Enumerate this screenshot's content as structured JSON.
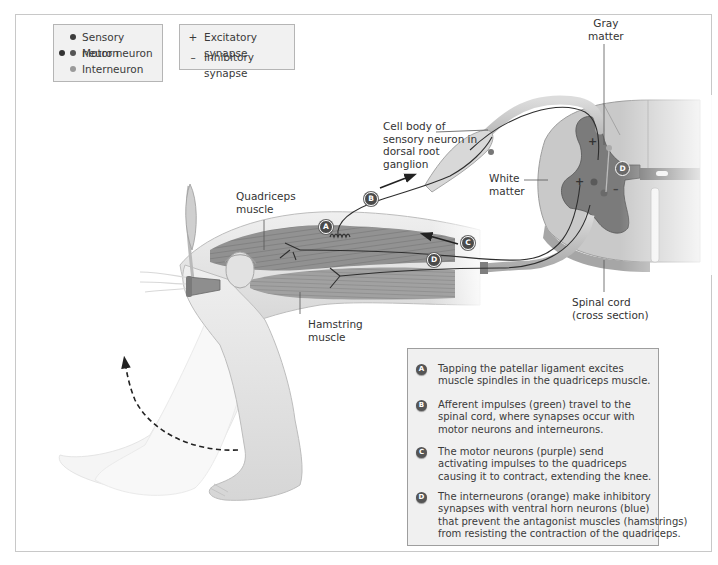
{
  "legend": {
    "neurons": [
      {
        "label": "Sensory neuron",
        "dot_colors": [
          "#3c3c3c"
        ]
      },
      {
        "label": "Motor neuron",
        "dot_colors": [
          "#333333",
          "#555555"
        ]
      },
      {
        "label": "Interneuron",
        "dot_colors": [
          "#9a9a9a"
        ]
      }
    ],
    "synapses": [
      {
        "symbol": "+",
        "label": "Excitatory synapse"
      },
      {
        "symbol": "–",
        "label": "Inhibitory synapse"
      }
    ]
  },
  "labels": {
    "gray_matter": "Gray\nmatter",
    "cell_body": "Cell body of\nsensory neuron in\ndorsal root\nganglion",
    "white_matter": "White\nmatter",
    "quadriceps": "Quadriceps\nmuscle",
    "hamstring": "Hamstring\nmuscle",
    "spinal_cord": "Spinal cord\n(cross section)"
  },
  "badges": {
    "a": "A",
    "b": "B",
    "c": "C",
    "d": "D",
    "d_spine": "D"
  },
  "synapse_marks": {
    "excitatory_top": "+",
    "excitatory_left": "+",
    "inhibitory": "–"
  },
  "steps": [
    {
      "badge": "A",
      "text": "Tapping the patellar ligament excites\nmuscle spindles in the quadriceps muscle."
    },
    {
      "badge": "B",
      "text": "Afferent impulses (green) travel to the\nspinal cord, where synapses occur with\nmotor neurons and interneurons."
    },
    {
      "badge": "C",
      "text": "The motor neurons (purple) send\nactivating impulses to the quadriceps\ncausing it to contract, extending the knee."
    },
    {
      "badge": "D",
      "text": "The interneurons (orange) make inhibitory\nsynapses with ventral horn neurons (blue)\nthat prevent the antagonist muscles (hamstrings)\nfrom resisting the contraction of the quadriceps."
    }
  ],
  "colors": {
    "gray_matter": "#7a7a7a",
    "white_matter": "#c9c9c9",
    "nerve": "#bdbdbd",
    "neuron_line": "#2e2e2e",
    "skin": "#e6e6e6",
    "muscle": "#8c8c8c"
  }
}
